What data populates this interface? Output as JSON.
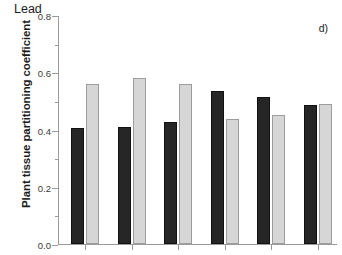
{
  "chart_data": {
    "type": "bar",
    "title": "Lead",
    "panel_label": "d)",
    "xlabel": "",
    "ylabel": "Plant tissue partitioning coefficient",
    "categories": [
      "1",
      "2",
      "3",
      "4",
      "5",
      "6"
    ],
    "series": [
      {
        "name": "series-black",
        "color": "#262626",
        "values": [
          0.405,
          0.41,
          0.425,
          0.535,
          0.515,
          0.485
        ]
      },
      {
        "name": "series-gray",
        "color": "#d6d6d6",
        "values": [
          0.56,
          0.58,
          0.56,
          0.435,
          0.45,
          0.49
        ]
      }
    ],
    "ylim": [
      0.0,
      0.8
    ],
    "ytick_labels": [
      "0.0",
      "0.2",
      "0.4",
      "0.6",
      "0.8"
    ],
    "ytick_values": [
      0.0,
      0.2,
      0.4,
      0.6,
      0.8
    ],
    "yminor_values": [
      0.1,
      0.3,
      0.5,
      0.7
    ],
    "grid": false,
    "legend": "none",
    "frame": "left-bottom"
  }
}
